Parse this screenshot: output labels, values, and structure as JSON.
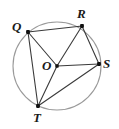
{
  "figure": {
    "type": "geometry-diagram",
    "canvas": {
      "width": 119,
      "height": 129
    },
    "colors": {
      "circle_stroke": "#9a9a9a",
      "segment_stroke": "#3a3a3a",
      "point_fill": "#111111",
      "label_color": "#1a1a1a",
      "background": "#ffffff"
    },
    "circle": {
      "name": "circle-O",
      "center_label": "O",
      "cx": 57,
      "cy": 66,
      "r": 44,
      "stroke_width": 1.1
    },
    "points": [
      {
        "id": "Q",
        "label": "Q",
        "x": 28,
        "y": 32,
        "label_x": 12,
        "label_y": 20
      },
      {
        "id": "R",
        "label": "R",
        "x": 82,
        "y": 26,
        "label_x": 77,
        "label_y": 7
      },
      {
        "id": "S",
        "label": "S",
        "x": 99,
        "y": 64,
        "label_x": 103,
        "label_y": 57
      },
      {
        "id": "T",
        "label": "T",
        "x": 38,
        "y": 106,
        "label_x": 33,
        "label_y": 111
      },
      {
        "id": "O",
        "label": "O",
        "x": 57,
        "y": 66,
        "label_x": 42,
        "label_y": 59
      }
    ],
    "segments": [
      {
        "name": "segment-QR",
        "from": "Q",
        "to": "R"
      },
      {
        "name": "segment-QO",
        "from": "Q",
        "to": "O"
      },
      {
        "name": "segment-QT",
        "from": "Q",
        "to": "T"
      },
      {
        "name": "segment-OR",
        "from": "O",
        "to": "R"
      },
      {
        "name": "segment-OS",
        "from": "O",
        "to": "S"
      },
      {
        "name": "segment-OT",
        "from": "O",
        "to": "T"
      },
      {
        "name": "segment-RS",
        "from": "R",
        "to": "S"
      },
      {
        "name": "segment-TS",
        "from": "T",
        "to": "S"
      }
    ]
  }
}
